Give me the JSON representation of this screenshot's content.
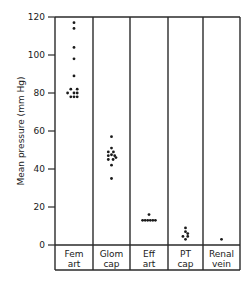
{
  "chart_data": {
    "type": "scatter",
    "title": "",
    "xlabel": "",
    "ylabel": "Mean pressure (mm Hg)",
    "ylim": [
      0,
      120
    ],
    "yticks": [
      0,
      20,
      40,
      60,
      80,
      100,
      120
    ],
    "grid": false,
    "legend": null,
    "categories": [
      {
        "line1": "Fem",
        "line2": "art"
      },
      {
        "line1": "Glom",
        "line2": "cap"
      },
      {
        "line1": "Eff",
        "line2": "art"
      },
      {
        "line1": "PT",
        "line2": "cap"
      },
      {
        "line1": "Renal",
        "line2": "vein"
      }
    ],
    "series": [
      {
        "name": "Fem art",
        "points": [
          {
            "dx": 0,
            "y": 117
          },
          {
            "dx": 0,
            "y": 114
          },
          {
            "dx": 0,
            "y": 104
          },
          {
            "dx": 0,
            "y": 98
          },
          {
            "dx": 0,
            "y": 89
          },
          {
            "dx": -1,
            "y": 82
          },
          {
            "dx": 1,
            "y": 82
          },
          {
            "dx": -2,
            "y": 80
          },
          {
            "dx": 0,
            "y": 80
          },
          {
            "dx": 1,
            "y": 80
          },
          {
            "dx": -1,
            "y": 78
          },
          {
            "dx": 0,
            "y": 78
          },
          {
            "dx": 1,
            "y": 78
          }
        ]
      },
      {
        "name": "Glom cap",
        "points": [
          {
            "dx": 0,
            "y": 57
          },
          {
            "dx": 0,
            "y": 51
          },
          {
            "dx": -1,
            "y": 49
          },
          {
            "dx": 0.6,
            "y": 49
          },
          {
            "dx": -1,
            "y": 47
          },
          {
            "dx": 0,
            "y": 47.5
          },
          {
            "dx": 1,
            "y": 47
          },
          {
            "dx": -1,
            "y": 45
          },
          {
            "dx": 0.5,
            "y": 45
          },
          {
            "dx": 1.4,
            "y": 46
          },
          {
            "dx": 0,
            "y": 42
          },
          {
            "dx": 0,
            "y": 35
          }
        ]
      },
      {
        "name": "Eff art",
        "points": [
          {
            "dx": 0,
            "y": 16
          },
          {
            "dx": -2,
            "y": 13
          },
          {
            "dx": -1.2,
            "y": 13
          },
          {
            "dx": -0.4,
            "y": 13
          },
          {
            "dx": 0.4,
            "y": 13
          },
          {
            "dx": 1.2,
            "y": 13
          },
          {
            "dx": 2,
            "y": 13
          }
        ]
      },
      {
        "name": "PT cap",
        "points": [
          {
            "dx": 0,
            "y": 9
          },
          {
            "dx": 0,
            "y": 7
          },
          {
            "dx": 0.7,
            "y": 6
          },
          {
            "dx": -0.8,
            "y": 4.5
          },
          {
            "dx": 0.7,
            "y": 4.5
          },
          {
            "dx": 0,
            "y": 3
          }
        ]
      },
      {
        "name": "Renal vein",
        "points": [
          {
            "dx": 0,
            "y": 3
          }
        ]
      }
    ]
  }
}
